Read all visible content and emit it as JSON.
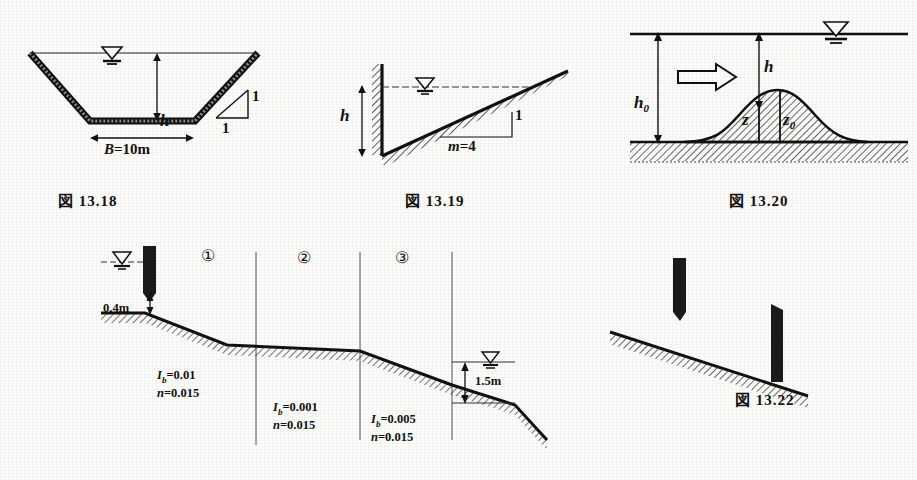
{
  "page": {
    "ink_color": "#1a1a1a",
    "paper_color": "#fdfdfb"
  },
  "figures": [
    {
      "id": "fig-13-18",
      "caption": "図 13.18",
      "description": "Trapezoidal open channel cross-section with 1:1 side slopes",
      "labels": {
        "depth": "h",
        "bottom_width": "B=10m",
        "slope_vertical": "1",
        "slope_horizontal": "1",
        "water_surface_symbol": "water-surface-triangle"
      }
    },
    {
      "id": "fig-13-19",
      "caption": "図 13.19",
      "description": "Triangular channel with vertical left wall and inclined bed",
      "labels": {
        "depth": "h",
        "slope_ratio": "m=4",
        "slope_vertical": "1",
        "water_surface_symbol": "water-surface-triangle"
      }
    },
    {
      "id": "fig-13-20",
      "caption": "図 13.20",
      "description": "Steady flow over a submerged bed hump",
      "labels": {
        "upstream_depth": "h0",
        "depth_over_hump": "h",
        "hump_height_z": "z",
        "hump_height_z0": "z0",
        "flow_arrow": "flow-direction-arrow",
        "water_surface_symbol": "water-surface-triangle"
      }
    },
    {
      "id": "fig-13-21",
      "caption": "",
      "description": "Three-reach channel downstream of a sluice gate",
      "labels": {
        "gate_opening": "0.4m",
        "tailwater_depth": "1.5m",
        "reach_1_marker": "①",
        "reach_2_marker": "②",
        "reach_3_marker": "③",
        "water_surface_symbol": "water-surface-triangle"
      },
      "reaches": [
        {
          "marker": "①",
          "slope_symbol": "I",
          "slope_subscript": "b",
          "slope_value": "0.01",
          "roughness_symbol": "n",
          "roughness_value": "0.015"
        },
        {
          "marker": "②",
          "slope_symbol": "I",
          "slope_subscript": "b",
          "slope_value": "0.001",
          "roughness_symbol": "n",
          "roughness_value": "0.015"
        },
        {
          "marker": "③",
          "slope_symbol": "I",
          "slope_subscript": "b",
          "slope_value": "0.005",
          "roughness_symbol": "n",
          "roughness_value": "0.015"
        }
      ]
    },
    {
      "id": "fig-13-22",
      "caption": "図 13.22",
      "description": "Sloping channel bed with sluice gate and downstream sill",
      "labels": {
        "gate": "sluice-gate",
        "sill": "downstream-sill"
      }
    }
  ]
}
